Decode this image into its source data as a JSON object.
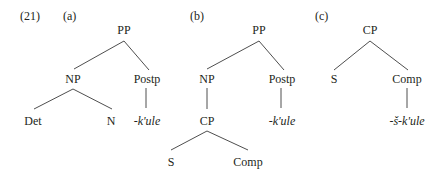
{
  "example": {
    "number": "(21)"
  },
  "trees": [
    {
      "id": "a",
      "label": "(a)",
      "nodes": {
        "root": "PP",
        "np": "NP",
        "postp": "Postp",
        "det": "Det",
        "n": "N",
        "morpheme": "-k'ule"
      }
    },
    {
      "id": "b",
      "label": "(b)",
      "nodes": {
        "root": "PP",
        "np": "NP",
        "postp": "Postp",
        "cp": "CP",
        "morpheme": "-k'ule",
        "s": "S",
        "comp": "Comp"
      }
    },
    {
      "id": "c",
      "label": "(c)",
      "nodes": {
        "root": "CP",
        "s": "S",
        "comp": "Comp",
        "morpheme": "-š-k'ule"
      }
    }
  ],
  "colors": {
    "text": "#231f20",
    "edges": "#3a3a3a",
    "background": "#ffffff"
  }
}
